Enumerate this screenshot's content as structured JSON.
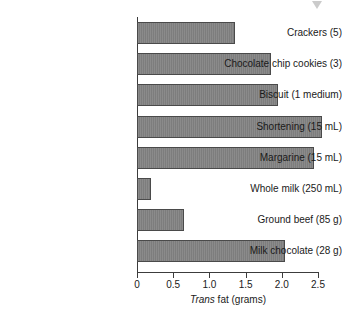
{
  "chart_data": {
    "type": "bar",
    "orientation": "horizontal",
    "title": "",
    "xlabel": "Trans fat (grams)",
    "xlabel_italic_part": "Trans",
    "xlabel_roman_part": " fat (grams)",
    "ylabel": "",
    "xlim": [
      0,
      2.5
    ],
    "xticks": [
      0,
      0.5,
      1.0,
      1.5,
      2.0,
      2.5
    ],
    "xtick_labels": [
      "0",
      "0.5",
      "1.0",
      "1.5",
      "2.0",
      "2.5"
    ],
    "grid": false,
    "legend": null,
    "bar_color": "#828282",
    "bar_edge_color": "#4a4a4a",
    "categories": [
      "Crackers (5)",
      "Chocolate chip cookies (3)",
      "Biscuit (1 medium)",
      "Shortening (15 mL)",
      "Margarine (15 mL)",
      "Whole milk (250 mL)",
      "Ground beef (85 g)",
      "Milk chocolate (28 g)"
    ],
    "values": [
      1.35,
      1.85,
      1.95,
      2.55,
      2.45,
      0.2,
      0.65,
      2.05
    ]
  },
  "artifact": {
    "name": "gray-triangle-marker"
  }
}
